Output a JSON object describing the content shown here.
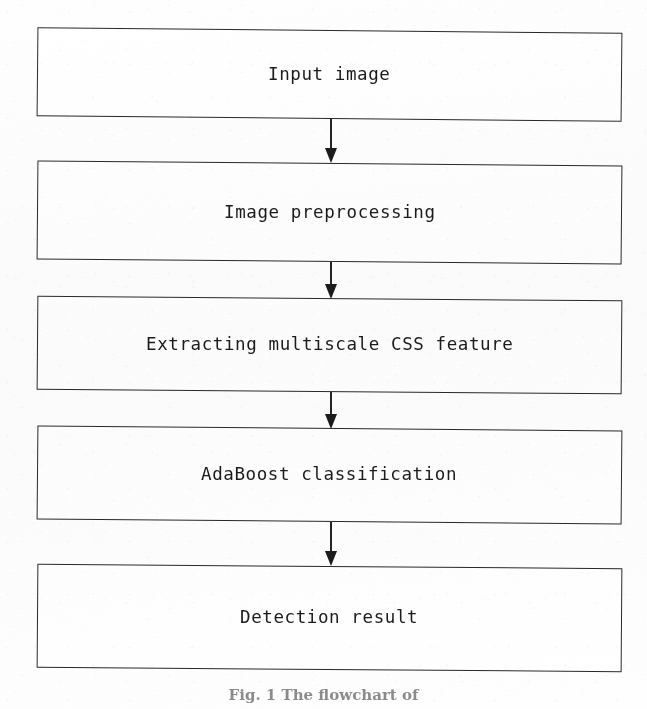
{
  "figure": {
    "caption": "Fig. 1  The flowchart of",
    "ink_color": "#1b1b1b",
    "border_color": "#2a2a2a",
    "background_color": "#ffffff"
  },
  "flowchart": {
    "type": "vertical-sequence",
    "nodes": [
      {
        "id": "input-image",
        "label": "Input image"
      },
      {
        "id": "image-preprocessing",
        "label": "Image preprocessing"
      },
      {
        "id": "extract-css",
        "label": "Extracting multiscale CSS feature"
      },
      {
        "id": "adaboost",
        "label": "AdaBoost classification"
      },
      {
        "id": "detection-result",
        "label": "Detection result"
      }
    ],
    "connectors": [
      {
        "id": "arrow-1",
        "from": "input-image",
        "to": "image-preprocessing",
        "direction": "down"
      },
      {
        "id": "arrow-2",
        "from": "image-preprocessing",
        "to": "extract-css",
        "direction": "down"
      },
      {
        "id": "arrow-3",
        "from": "extract-css",
        "to": "adaboost",
        "direction": "down"
      },
      {
        "id": "arrow-4",
        "from": "adaboost",
        "to": "detection-result",
        "direction": "down"
      }
    ]
  }
}
